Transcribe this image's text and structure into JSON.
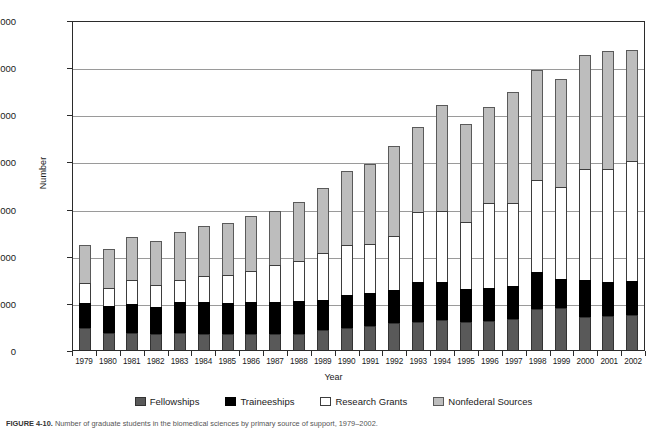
{
  "figure": {
    "caption_label": "FIGURE 4-10.",
    "caption_text": "Number of graduate students in the biomedical sciences by primary source of support, 1979–2002."
  },
  "chart_data": {
    "type": "bar",
    "subtype": "stacked-vertical",
    "title": "",
    "xlabel": "Year",
    "ylabel": "Number",
    "ylim": [
      0,
      14000
    ],
    "ytick_step": 2000,
    "ytick_labels": [
      "0",
      "2,000",
      "4,000",
      "6,000",
      "8,000",
      "10,000",
      "12,000",
      "14,000"
    ],
    "ytick_values": [
      0,
      2000,
      4000,
      6000,
      8000,
      10000,
      12000,
      14000
    ],
    "grid": "horizontal",
    "legend_position": "bottom",
    "categories": [
      "1979",
      "1980",
      "1981",
      "1982",
      "1983",
      "1984",
      "1985",
      "1986",
      "1987",
      "1988",
      "1989",
      "1990",
      "1991",
      "1992",
      "1993",
      "1994",
      "1995",
      "1996",
      "1997",
      "1998",
      "1999",
      "2000",
      "2001",
      "2002"
    ],
    "series": [
      {
        "name": "Fellowships",
        "color": "#595959",
        "values": [
          920,
          740,
          710,
          660,
          740,
          700,
          680,
          690,
          660,
          690,
          830,
          950,
          1020,
          1150,
          1200,
          1280,
          1200,
          1220,
          1300,
          1720,
          1800,
          1420,
          1450,
          1500
        ]
      },
      {
        "name": "Traineeships",
        "color": "#000000",
        "values": [
          1060,
          1120,
          1260,
          1180,
          1290,
          1340,
          1320,
          1340,
          1380,
          1400,
          1280,
          1390,
          1400,
          1400,
          1680,
          1600,
          1400,
          1400,
          1430,
          1580,
          1200,
          1540,
          1440,
          1440
        ]
      },
      {
        "name": "Research Grants",
        "color": "#ffffff",
        "values": [
          860,
          790,
          990,
          910,
          960,
          1080,
          1200,
          1340,
          1550,
          1700,
          2000,
          2100,
          2080,
          2300,
          2970,
          3000,
          2830,
          3600,
          3520,
          3900,
          3900,
          4730,
          4770,
          5090
        ]
      },
      {
        "name": "Nonfederal Sources",
        "color": "#bdbdbd",
        "values": [
          1610,
          1650,
          1840,
          1870,
          2020,
          2130,
          2170,
          2320,
          2310,
          2470,
          2780,
          3170,
          3400,
          3800,
          3620,
          4530,
          4140,
          4080,
          4680,
          4700,
          4600,
          4810,
          5040,
          4720
        ]
      }
    ],
    "totals": [
      4450,
      4300,
      4800,
      4620,
      5010,
      5250,
      5370,
      5690,
      5900,
      6260,
      6890,
      7610,
      7900,
      8650,
      9470,
      10410,
      9570,
      10300,
      10930,
      11900,
      11500,
      12500,
      12700,
      12750
    ]
  }
}
